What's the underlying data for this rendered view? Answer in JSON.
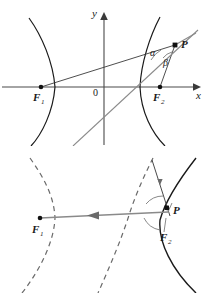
{
  "document": {
    "title": "Hyperbola reflection property — two figures",
    "figures": [
      {
        "id": "top",
        "caption": "",
        "axes": {
          "x_label": "x",
          "y_label": "y",
          "origin_label": "0"
        },
        "points": [
          {
            "name": "F1",
            "label": "F",
            "subscript": "1"
          },
          {
            "name": "F2",
            "label": "F",
            "subscript": "2"
          },
          {
            "name": "P",
            "label": "P",
            "subscript": ""
          }
        ],
        "angles": [
          {
            "name": "alpha",
            "label": "α"
          },
          {
            "name": "beta",
            "label": "β"
          }
        ]
      },
      {
        "id": "bottom",
        "caption": "",
        "points": [
          {
            "name": "F1",
            "label": "F",
            "subscript": "1"
          },
          {
            "name": "F2",
            "label": "F",
            "subscript": "2"
          },
          {
            "name": "P",
            "label": "P",
            "subscript": ""
          }
        ],
        "ray_direction": "toward-F1"
      }
    ]
  },
  "colors": {
    "curve": "#1a1a1a",
    "axis": "#4a4a4a",
    "ray_gray": "#8a8a8a",
    "ray_dark": "#3a3a3a",
    "dashed": "#6a6a6a",
    "text": "#1a1a1a",
    "background": "#ffffff"
  }
}
